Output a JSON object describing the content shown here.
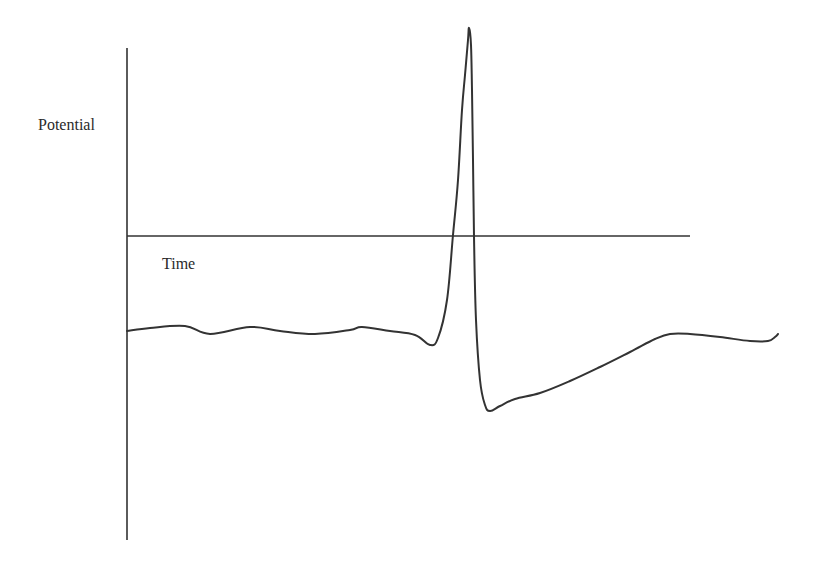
{
  "chart_data": {
    "type": "line",
    "title": "",
    "xlabel": "Time",
    "ylabel": "Potential",
    "grid": false,
    "legend": null,
    "axes": {
      "x_axis_position": "at zero potential (crosses y-axis)",
      "ticks": "none"
    },
    "series": [
      {
        "name": "Membrane potential",
        "color": "#333333",
        "points_px": [
          [
            127,
            331
          ],
          [
            150,
            328
          ],
          [
            185,
            326
          ],
          [
            210,
            334
          ],
          [
            250,
            327
          ],
          [
            280,
            331
          ],
          [
            315,
            334
          ],
          [
            350,
            330
          ],
          [
            362,
            327
          ],
          [
            390,
            331
          ],
          [
            415,
            335
          ],
          [
            430,
            345
          ],
          [
            438,
            338
          ],
          [
            447,
            300
          ],
          [
            453,
            235
          ],
          [
            458,
            180
          ],
          [
            462,
            110
          ],
          [
            465,
            75
          ],
          [
            468,
            40
          ],
          [
            469,
            28
          ],
          [
            471,
            45
          ],
          [
            472,
            90
          ],
          [
            473,
            160
          ],
          [
            474,
            236
          ],
          [
            476,
            320
          ],
          [
            480,
            380
          ],
          [
            485,
            405
          ],
          [
            490,
            411
          ],
          [
            500,
            406
          ],
          [
            515,
            399
          ],
          [
            540,
            393
          ],
          [
            570,
            381
          ],
          [
            600,
            367
          ],
          [
            630,
            352
          ],
          [
            655,
            339
          ],
          [
            670,
            334
          ],
          [
            690,
            334
          ],
          [
            720,
            337
          ],
          [
            750,
            341
          ],
          [
            768,
            341
          ],
          [
            775,
            337
          ],
          [
            778,
            334
          ]
        ]
      }
    ],
    "annotations": [
      {
        "text": "Potential",
        "role": "y-axis label"
      },
      {
        "text": "Time",
        "role": "x-axis label"
      }
    ]
  },
  "labels": {
    "y": "Potential",
    "x": "Time"
  },
  "colors": {
    "line": "#333333",
    "axis": "#333333",
    "text": "#2a2a2a",
    "background": "#ffffff"
  }
}
